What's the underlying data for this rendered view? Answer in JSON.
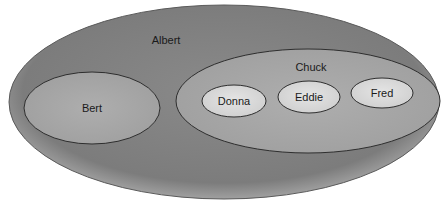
{
  "diagram": {
    "type": "nested-sets",
    "colors": {
      "background": "#ffffff",
      "outer_fill": "#7f7f7f",
      "outer_edge": "#b8b8b8",
      "mid_fill": "#a9a9a9",
      "inner_fill": "#dcdcdc",
      "stroke": "#2e2e2e"
    },
    "nodes": [
      {
        "id": "albert",
        "label": "Albert",
        "parent": null,
        "cx": 224,
        "cy": 102,
        "rx": 215,
        "ry": 97,
        "label_x": 166,
        "label_y": 44
      },
      {
        "id": "bert",
        "label": "Bert",
        "parent": "albert",
        "cx": 92,
        "cy": 108,
        "rx": 68,
        "ry": 36,
        "label_x": 92,
        "label_y": 112
      },
      {
        "id": "chuck",
        "label": "Chuck",
        "parent": "albert",
        "cx": 308,
        "cy": 101,
        "rx": 132,
        "ry": 52,
        "label_x": 311,
        "label_y": 71
      },
      {
        "id": "donna",
        "label": "Donna",
        "parent": "chuck",
        "cx": 234,
        "cy": 101,
        "rx": 32,
        "ry": 16,
        "label_x": 234,
        "label_y": 105
      },
      {
        "id": "eddie",
        "label": "Eddie",
        "parent": "chuck",
        "cx": 309,
        "cy": 97,
        "rx": 31,
        "ry": 16,
        "label_x": 309,
        "label_y": 101
      },
      {
        "id": "fred",
        "label": "Fred",
        "parent": "chuck",
        "cx": 382,
        "cy": 93,
        "rx": 31,
        "ry": 15,
        "label_x": 382,
        "label_y": 97
      }
    ]
  }
}
